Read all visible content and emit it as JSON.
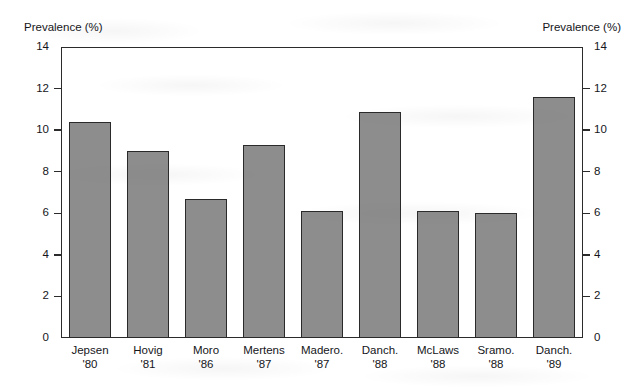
{
  "chart_data": {
    "type": "bar",
    "title": "",
    "xlabel": "",
    "ylabel": "Prevalence (%)",
    "ylabel_right": "Prevalence (%)",
    "ylim": [
      0,
      14
    ],
    "ytick_step": 2,
    "yticks": [
      0,
      2,
      4,
      6,
      8,
      10,
      12,
      14
    ],
    "ytick_labels": [
      "0",
      "2",
      "4",
      "6",
      "8",
      "10",
      "12",
      "14"
    ],
    "grid": false,
    "legend": null,
    "dual_axis": true,
    "categories": [
      "Jepsen '80",
      "Hovig '81",
      "Moro '86",
      "Mertens '87",
      "Madero. '87",
      "Danch. '88",
      "McLaws '88",
      "Sramo. '88",
      "Danch. '89"
    ],
    "category_parts": [
      {
        "name": "Jepsen",
        "year": "'80"
      },
      {
        "name": "Hovig",
        "year": "'81"
      },
      {
        "name": "Moro",
        "year": "'86"
      },
      {
        "name": "Mertens",
        "year": "'87"
      },
      {
        "name": "Madero.",
        "year": "'87"
      },
      {
        "name": "Danch.",
        "year": "'88"
      },
      {
        "name": "McLaws",
        "year": "'88"
      },
      {
        "name": "Sramo.",
        "year": "'88"
      },
      {
        "name": "Danch.",
        "year": "'89"
      }
    ],
    "values": [
      10.4,
      9.0,
      6.7,
      9.3,
      6.1,
      10.85,
      6.1,
      6.0,
      11.6
    ],
    "bar_fill_color": "#8d8d8d",
    "bar_edge_color": "#2a2a2a",
    "axis_color": "#2b2b2b",
    "background_color": "#ffffff"
  }
}
